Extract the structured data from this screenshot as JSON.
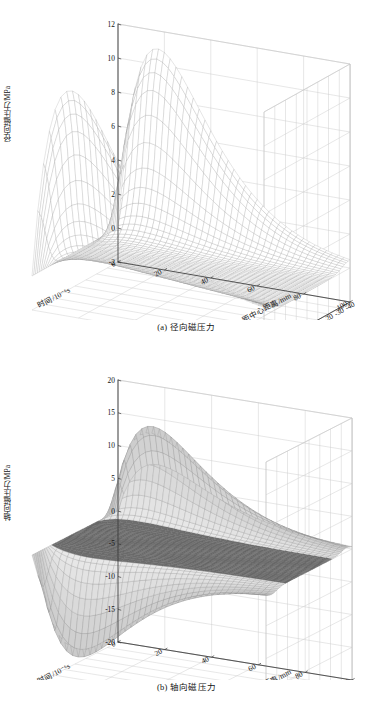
{
  "document": {
    "type": "figure-pair",
    "background": "#ffffff"
  },
  "figures": [
    {
      "id": "fig-a",
      "caption": "(a) 径向磁压力",
      "zlabel": "径向磁压力/MPa",
      "xlabel": "距中心距离/mm",
      "ylabel": "时间/10⁻⁶s",
      "zticks": [
        "-2",
        "0",
        "2",
        "4",
        "6",
        "8",
        "10",
        "12"
      ],
      "xticks": [
        "-40",
        "-30",
        "-20",
        "-10",
        "0",
        "10",
        "20",
        "30",
        "40"
      ],
      "yticks": [
        "0",
        "20",
        "40",
        "60",
        "80",
        "100"
      ]
    },
    {
      "id": "fig-b",
      "caption": "(b) 轴向磁压力",
      "zlabel": "轴向磁压力/MPa",
      "xlabel": "距中心距离/mm",
      "ylabel": "时间/10⁻⁶s",
      "zticks": [
        "-20",
        "-15",
        "-10",
        "-5",
        "0",
        "5",
        "10",
        "15",
        "20"
      ],
      "xticks": [
        "-40",
        "-30",
        "-20",
        "-10",
        "0",
        "10",
        "20",
        "30",
        "40"
      ],
      "yticks": [
        "0",
        "20",
        "40",
        "60",
        "80",
        "100"
      ]
    }
  ],
  "chart_data": [
    {
      "type": "surface",
      "title": "(a) 径向磁压力",
      "xlabel": "距中心距离/mm",
      "ylabel": "时间/10⁻⁶s",
      "zlabel": "径向磁压力/MPa",
      "xlim": [
        -40,
        40
      ],
      "ylim": [
        0,
        100
      ],
      "zlim": [
        -2,
        12
      ],
      "xticks": [
        -40,
        -30,
        -20,
        -10,
        0,
        10,
        20,
        30,
        40
      ],
      "yticks": [
        0,
        20,
        40,
        60,
        80,
        100
      ],
      "zticks": [
        -2,
        0,
        2,
        4,
        6,
        8,
        10,
        12
      ],
      "grid": true,
      "legend": "none",
      "mesh": "fine-wireframe-white",
      "description": "Radial magnetic pressure is near zero across the centre region of the coil and rises to two symmetric ridges at the tube edges (|r| ≈ 30–40 mm). Along time it forms a single damped pulse peaking near t ≈ 15–20 µs.",
      "peaks": [
        {
          "x": -38,
          "y": 18,
          "z": 9.6
        },
        {
          "x": 38,
          "y": 18,
          "z": 11.8
        }
      ],
      "plateau_z": 0.0,
      "ridge_crest_z": 5.2,
      "surface_samples": {
        "comment": "z(r,t) ≈ A(r)·t/τ·exp(1-t/τ), with A(r) peaking at the tube ends",
        "r": [
          -40,
          -35,
          -30,
          -25,
          -20,
          -15,
          -10,
          -5,
          0,
          5,
          10,
          15,
          20,
          25,
          30,
          35,
          40
        ],
        "A": [
          11.2,
          9.0,
          4.0,
          1.4,
          0.6,
          0.35,
          0.25,
          0.2,
          0.2,
          0.2,
          0.25,
          0.35,
          0.6,
          1.4,
          4.0,
          9.0,
          11.6
        ],
        "tau_us": 17,
        "t": [
          0,
          10,
          20,
          30,
          40,
          50,
          60,
          70,
          80,
          90,
          100
        ]
      }
    },
    {
      "type": "surface",
      "title": "(b) 轴向磁压力",
      "xlabel": "距中心距离/mm",
      "ylabel": "时间/10⁻⁶s",
      "zlabel": "轴向磁压力/MPa",
      "xlim": [
        -40,
        40
      ],
      "ylim": [
        0,
        100
      ],
      "zlim": [
        -20,
        20
      ],
      "xticks": [
        -40,
        -30,
        -20,
        -10,
        0,
        10,
        20,
        30,
        40
      ],
      "yticks": [
        0,
        20,
        40,
        60,
        80,
        100
      ],
      "zticks": [
        -20,
        -15,
        -10,
        -5,
        0,
        5,
        10,
        15,
        20
      ],
      "grid": true,
      "legend": "none",
      "mesh": "fine-wireframe-shaded",
      "description": "Axial magnetic pressure is antisymmetric about the tube centre: a large positive lobe near r ≈ -35 mm (max ≈ +16 MPa) and an equal negative lobe near r ≈ +35 mm (min ≈ -17 MPa), with a flat near-zero plateau between. The time dependence is a single damped pulse peaking near t ≈ 15–20 µs.",
      "peaks": [
        {
          "x": -35,
          "y": 18,
          "z": 16.2
        }
      ],
      "troughs": [
        {
          "x": 35,
          "y": 18,
          "z": -17.0
        }
      ],
      "plateau_z": 0.0,
      "surface_samples": {
        "comment": "z(r,t) ≈ B(r)·t/τ·exp(1-t/τ), antisymmetric in r",
        "r": [
          -40,
          -35,
          -30,
          -25,
          -20,
          -15,
          -10,
          -5,
          0,
          5,
          10,
          15,
          20,
          25,
          30,
          35,
          40
        ],
        "B": [
          7.0,
          16.2,
          9.0,
          2.0,
          0.4,
          0.1,
          0.0,
          0.0,
          0.0,
          0.0,
          0.0,
          -0.1,
          -0.4,
          -2.0,
          -9.0,
          -17.0,
          -7.5
        ],
        "tau_us": 17,
        "t": [
          0,
          10,
          20,
          30,
          40,
          50,
          60,
          70,
          80,
          90,
          100
        ]
      }
    }
  ]
}
